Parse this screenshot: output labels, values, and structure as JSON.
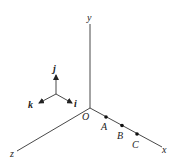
{
  "diagram": {
    "axes": {
      "x": "x",
      "y": "y",
      "z": "z"
    },
    "origin_label": "O",
    "unit_vectors": {
      "i": "i",
      "j": "j",
      "k": "k"
    },
    "points": [
      {
        "label": "A"
      },
      {
        "label": "B"
      },
      {
        "label": "C"
      }
    ],
    "colors": {
      "line": "#333333",
      "background": "#ffffff"
    }
  }
}
